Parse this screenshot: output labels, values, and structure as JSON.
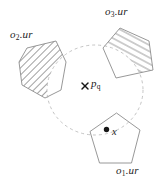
{
  "figure": {
    "labels": {
      "o2": {
        "base": "o",
        "sub": "2",
        "rest": ".ur"
      },
      "o3": {
        "base": "o",
        "sub": "3",
        "rest": ".ur"
      },
      "o1": {
        "base": "o",
        "sub": "1",
        "rest": ".ur"
      },
      "query_point": {
        "base": "p",
        "sub": "q"
      },
      "sample_point": {
        "text": "x"
      }
    },
    "markers": {
      "query": "x-cross-marker",
      "sample": "filled-dot-marker"
    },
    "colors": {
      "background": "#ffffff",
      "outline": "#8c8c8c",
      "hatch": "#969696",
      "dashed_circle": "#b5b5b5",
      "marker": "#161616",
      "text": "#1c1c1c"
    }
  }
}
